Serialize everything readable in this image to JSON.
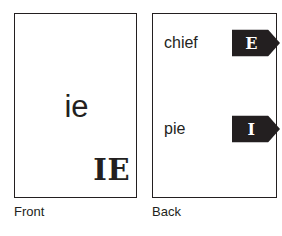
{
  "colors": {
    "ink": "#231f20",
    "paper": "#ffffff",
    "tag_fill": "#231f20",
    "tag_text": "#ffffff"
  },
  "front_card": {
    "name": "Front",
    "main_text": "ie",
    "corner_text": "IE",
    "caption": "Front"
  },
  "back_card": {
    "name": "Back",
    "caption": "Back",
    "entries": [
      {
        "word": "chief",
        "tag_letter": "E",
        "tag_shape": "right-arrow-tag"
      },
      {
        "word": "pie",
        "tag_letter": "I",
        "tag_shape": "right-arrow-tag"
      }
    ]
  }
}
